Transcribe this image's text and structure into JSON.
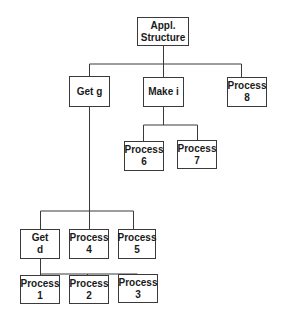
{
  "diagram": {
    "type": "hierarchy-tree",
    "nodes": [
      {
        "id": "root",
        "line1": "Appl.",
        "line2": "Structure"
      },
      {
        "id": "getg",
        "line1": "Get g",
        "line2": ""
      },
      {
        "id": "makei",
        "line1": "Make i",
        "line2": ""
      },
      {
        "id": "p8",
        "line1": "Process",
        "line2": "8"
      },
      {
        "id": "p6",
        "line1": "Process",
        "line2": "6"
      },
      {
        "id": "p7",
        "line1": "Process",
        "line2": "7"
      },
      {
        "id": "getd",
        "line1": "Get",
        "line2": "d"
      },
      {
        "id": "p4",
        "line1": "Process",
        "line2": "4"
      },
      {
        "id": "p5",
        "line1": "Process",
        "line2": "5"
      },
      {
        "id": "p1",
        "line1": "Process",
        "line2": "1"
      },
      {
        "id": "p2",
        "line1": "Process",
        "line2": "2"
      },
      {
        "id": "p3",
        "line1": "Process",
        "line2": "3"
      }
    ],
    "edges": [
      [
        "root",
        "getg"
      ],
      [
        "root",
        "makei"
      ],
      [
        "root",
        "p8"
      ],
      [
        "makei",
        "p6"
      ],
      [
        "makei",
        "p7"
      ],
      [
        "getg",
        "getd"
      ],
      [
        "getg",
        "p4"
      ],
      [
        "getg",
        "p5"
      ],
      [
        "getd",
        "p1"
      ],
      [
        "getd",
        "p2"
      ],
      [
        "getd",
        "p3"
      ]
    ],
    "colors": {
      "line": "#3a3a3a",
      "box_border": "#3a3a3a",
      "text": "#1a1a1a",
      "background": "#ffffff"
    }
  }
}
